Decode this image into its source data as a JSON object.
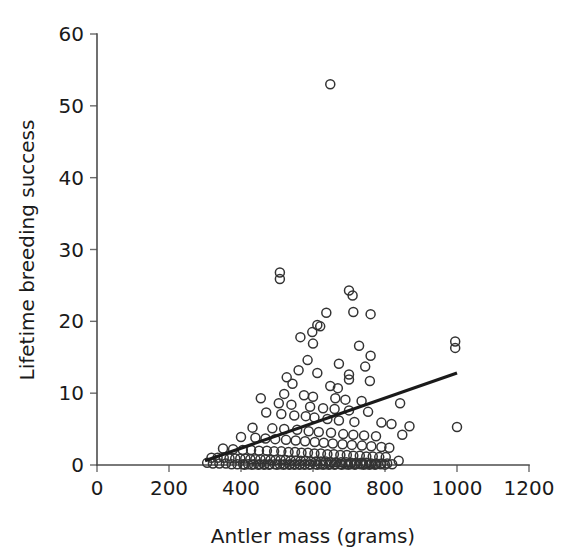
{
  "chart_data": {
    "type": "scatter",
    "title": "",
    "xlabel": "Antler mass (grams)",
    "ylabel": "Lifetime breeding success",
    "xlim": [
      0,
      1200
    ],
    "ylim": [
      0,
      60
    ],
    "xticks": [
      0,
      200,
      400,
      600,
      800,
      1000,
      1200
    ],
    "yticks": [
      0,
      10,
      20,
      30,
      40,
      50,
      60
    ],
    "grid": false,
    "legend": null,
    "marker": "open-circle",
    "marker_color": "#333333",
    "marker_size": 9,
    "trendline": {
      "type": "linear",
      "color": "#1a1a1a",
      "x_start": 300,
      "y_start": 0.6,
      "x_end": 1000,
      "y_end": 12.8
    },
    "annotations": [
      {
        "text": "outlier",
        "x": 648,
        "y": 53
      }
    ],
    "points": [
      [
        648,
        53.0
      ],
      [
        508,
        26.8
      ],
      [
        508,
        25.9
      ],
      [
        700,
        24.3
      ],
      [
        710,
        23.6
      ],
      [
        712,
        21.3
      ],
      [
        637,
        21.2
      ],
      [
        760,
        21.0
      ],
      [
        612,
        19.5
      ],
      [
        620,
        19.3
      ],
      [
        598,
        18.5
      ],
      [
        565,
        17.8
      ],
      [
        995,
        17.2
      ],
      [
        995,
        16.3
      ],
      [
        600,
        16.9
      ],
      [
        728,
        16.6
      ],
      [
        760,
        15.2
      ],
      [
        585,
        14.6
      ],
      [
        672,
        14.1
      ],
      [
        745,
        13.7
      ],
      [
        560,
        13.2
      ],
      [
        612,
        12.8
      ],
      [
        700,
        12.6
      ],
      [
        527,
        12.2
      ],
      [
        700,
        11.9
      ],
      [
        758,
        11.7
      ],
      [
        543,
        11.3
      ],
      [
        648,
        11.0
      ],
      [
        669,
        10.7
      ],
      [
        455,
        9.3
      ],
      [
        520,
        9.9
      ],
      [
        575,
        9.7
      ],
      [
        600,
        9.5
      ],
      [
        662,
        9.3
      ],
      [
        690,
        9.1
      ],
      [
        735,
        8.9
      ],
      [
        842,
        8.6
      ],
      [
        505,
        8.6
      ],
      [
        540,
        8.4
      ],
      [
        592,
        8.1
      ],
      [
        628,
        7.9
      ],
      [
        660,
        7.8
      ],
      [
        700,
        7.6
      ],
      [
        753,
        7.4
      ],
      [
        470,
        7.3
      ],
      [
        512,
        7.1
      ],
      [
        548,
        6.9
      ],
      [
        580,
        6.8
      ],
      [
        604,
        6.6
      ],
      [
        640,
        6.4
      ],
      [
        672,
        6.2
      ],
      [
        715,
        6.0
      ],
      [
        790,
        5.9
      ],
      [
        818,
        5.7
      ],
      [
        868,
        5.4
      ],
      [
        1000,
        5.3
      ],
      [
        432,
        5.2
      ],
      [
        487,
        5.1
      ],
      [
        520,
        5.0
      ],
      [
        556,
        4.9
      ],
      [
        588,
        4.7
      ],
      [
        616,
        4.6
      ],
      [
        650,
        4.5
      ],
      [
        684,
        4.3
      ],
      [
        712,
        4.2
      ],
      [
        742,
        4.1
      ],
      [
        775,
        4.0
      ],
      [
        848,
        4.2
      ],
      [
        400,
        3.9
      ],
      [
        440,
        3.8
      ],
      [
        468,
        3.7
      ],
      [
        495,
        3.6
      ],
      [
        525,
        3.5
      ],
      [
        552,
        3.4
      ],
      [
        578,
        3.3
      ],
      [
        605,
        3.2
      ],
      [
        630,
        3.1
      ],
      [
        655,
        3.0
      ],
      [
        682,
        2.9
      ],
      [
        708,
        2.8
      ],
      [
        736,
        2.7
      ],
      [
        762,
        2.6
      ],
      [
        790,
        2.5
      ],
      [
        812,
        2.4
      ],
      [
        350,
        2.3
      ],
      [
        378,
        2.2
      ],
      [
        405,
        2.1
      ],
      [
        428,
        2.1
      ],
      [
        450,
        2.0
      ],
      [
        472,
        2.0
      ],
      [
        492,
        1.9
      ],
      [
        512,
        1.9
      ],
      [
        532,
        1.8
      ],
      [
        550,
        1.8
      ],
      [
        568,
        1.7
      ],
      [
        586,
        1.7
      ],
      [
        604,
        1.6
      ],
      [
        622,
        1.6
      ],
      [
        640,
        1.5
      ],
      [
        658,
        1.5
      ],
      [
        676,
        1.4
      ],
      [
        694,
        1.4
      ],
      [
        712,
        1.3
      ],
      [
        730,
        1.3
      ],
      [
        748,
        1.2
      ],
      [
        766,
        1.2
      ],
      [
        784,
        1.1
      ],
      [
        802,
        1.1
      ],
      [
        318,
        1.0
      ],
      [
        335,
        1.0
      ],
      [
        352,
        1.0
      ],
      [
        368,
        0.9
      ],
      [
        384,
        0.9
      ],
      [
        398,
        0.9
      ],
      [
        412,
        0.9
      ],
      [
        426,
        0.8
      ],
      [
        440,
        0.8
      ],
      [
        454,
        0.8
      ],
      [
        468,
        0.8
      ],
      [
        482,
        0.7
      ],
      [
        496,
        0.7
      ],
      [
        510,
        0.7
      ],
      [
        524,
        0.7
      ],
      [
        538,
        0.6
      ],
      [
        552,
        0.6
      ],
      [
        566,
        0.6
      ],
      [
        580,
        0.6
      ],
      [
        594,
        0.5
      ],
      [
        608,
        0.5
      ],
      [
        622,
        0.5
      ],
      [
        636,
        0.5
      ],
      [
        650,
        0.4
      ],
      [
        664,
        0.4
      ],
      [
        678,
        0.4
      ],
      [
        692,
        0.4
      ],
      [
        706,
        0.3
      ],
      [
        720,
        0.3
      ],
      [
        734,
        0.3
      ],
      [
        748,
        0.3
      ],
      [
        762,
        0.2
      ],
      [
        776,
        0.2
      ],
      [
        790,
        0.2
      ],
      [
        806,
        0.2
      ],
      [
        306,
        0.3
      ],
      [
        322,
        0.2
      ],
      [
        340,
        0.2
      ],
      [
        358,
        0.2
      ],
      [
        374,
        0.1
      ],
      [
        390,
        0.1
      ],
      [
        406,
        0.1
      ],
      [
        420,
        0.1
      ],
      [
        436,
        0.1
      ],
      [
        452,
        0.1
      ],
      [
        466,
        0.1
      ],
      [
        480,
        0.1
      ],
      [
        494,
        0.1
      ],
      [
        508,
        0.1
      ],
      [
        522,
        0.1
      ],
      [
        536,
        0.1
      ],
      [
        550,
        0.1
      ],
      [
        564,
        0.1
      ],
      [
        578,
        0.1
      ],
      [
        592,
        0.1
      ],
      [
        606,
        0.1
      ],
      [
        620,
        0.1
      ],
      [
        634,
        0.1
      ],
      [
        648,
        0.1
      ],
      [
        662,
        0.1
      ],
      [
        676,
        0.1
      ],
      [
        690,
        0.1
      ],
      [
        704,
        0.1
      ],
      [
        718,
        0.1
      ],
      [
        732,
        0.1
      ],
      [
        746,
        0.1
      ],
      [
        760,
        0.1
      ],
      [
        774,
        0.1
      ],
      [
        788,
        0.1
      ],
      [
        820,
        0.1
      ],
      [
        838,
        0.6
      ],
      [
        410,
        0.05
      ],
      [
        430,
        0.05
      ],
      [
        448,
        0.05
      ],
      [
        464,
        0.05
      ],
      [
        478,
        0.05
      ],
      [
        500,
        0.05
      ],
      [
        518,
        0.05
      ],
      [
        534,
        0.05
      ],
      [
        548,
        0.05
      ],
      [
        562,
        0.05
      ],
      [
        576,
        0.05
      ],
      [
        590,
        0.05
      ],
      [
        612,
        0.05
      ],
      [
        628,
        0.05
      ],
      [
        644,
        0.05
      ],
      [
        660,
        0.05
      ],
      [
        680,
        0.05
      ],
      [
        698,
        0.05
      ],
      [
        716,
        0.05
      ],
      [
        740,
        0.05
      ],
      [
        756,
        0.05
      ],
      [
        772,
        0.05
      ],
      [
        800,
        0.05
      ]
    ]
  }
}
